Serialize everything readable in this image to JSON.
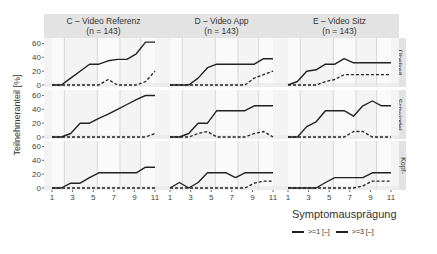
{
  "chart_data": {
    "type": "line",
    "layout": "facet-grid",
    "x": [
      1,
      2,
      3,
      4,
      5,
      6,
      7,
      8,
      9,
      10,
      11
    ],
    "xlabel": "Zeit [min]",
    "ylabel": "Teilnehmeranteil [%]",
    "x_ticks": [
      "1",
      "3",
      "5",
      "7",
      "9",
      "11"
    ],
    "y_ticks": [
      "0",
      "20",
      "40",
      "60"
    ],
    "ylim": [
      0,
      65
    ],
    "xlim": [
      1,
      11
    ],
    "columns": [
      {
        "title": "C – Video Referenz",
        "subtitle": "(n = 143)"
      },
      {
        "title": "D – Video App",
        "subtitle": "(n = 143)"
      },
      {
        "title": "E – Video Sitz",
        "subtitle": "(n = 143)"
      }
    ],
    "rows": [
      "Übelkeit",
      "Schwindel",
      "Kopf-\nschmerzen"
    ],
    "legend": {
      "title": "Symptomausprägung",
      "position": "bottom-right",
      "entries": [
        {
          "label": ">=1 [–]",
          "style": "solid"
        },
        {
          "label": ">=3 [–]",
          "style": "dashed"
        }
      ]
    },
    "shaded_intervals": [
      [
        1,
        2.2
      ],
      [
        5.4,
        7.6
      ],
      [
        9.6,
        11
      ]
    ],
    "panels": [
      {
        "row": 0,
        "col": 0,
        "series": [
          {
            "name": ">=1 [–]",
            "values": [
              0,
              0,
              10,
              20,
              30,
              30,
              35,
              37,
              37,
              45,
              62,
              62
            ]
          },
          {
            "name": ">=3 [–]",
            "values": [
              0,
              0,
              0,
              0,
              0,
              0,
              8,
              0,
              0,
              0,
              5,
              20
            ]
          }
        ]
      },
      {
        "row": 0,
        "col": 1,
        "series": [
          {
            "name": ">=1 [–]",
            "values": [
              0,
              0,
              0,
              10,
              25,
              30,
              30,
              30,
              30,
              30,
              38,
              38
            ]
          },
          {
            "name": ">=3 [–]",
            "values": [
              0,
              0,
              0,
              0,
              0,
              0,
              0,
              0,
              0,
              10,
              15,
              20
            ]
          }
        ]
      },
      {
        "row": 0,
        "col": 2,
        "series": [
          {
            "name": ">=1 [–]",
            "values": [
              0,
              5,
              20,
              22,
              30,
              30,
              38,
              32,
              32,
              32,
              32,
              32
            ]
          },
          {
            "name": ">=3 [–]",
            "values": [
              0,
              0,
              0,
              0,
              5,
              8,
              15,
              15,
              15,
              15,
              15,
              15
            ]
          }
        ]
      },
      {
        "row": 1,
        "col": 0,
        "series": [
          {
            "name": ">=1 [–]",
            "values": [
              0,
              0,
              5,
              20,
              20,
              27,
              33,
              40,
              47,
              54,
              60,
              60
            ]
          },
          {
            "name": ">=3 [–]",
            "values": [
              0,
              0,
              0,
              0,
              0,
              0,
              0,
              0,
              0,
              0,
              0,
              5
            ]
          }
        ]
      },
      {
        "row": 1,
        "col": 1,
        "series": [
          {
            "name": ">=1 [–]",
            "values": [
              0,
              0,
              5,
              20,
              20,
              38,
              38,
              38,
              38,
              45,
              45,
              45
            ]
          },
          {
            "name": ">=3 [–]",
            "values": [
              0,
              0,
              0,
              5,
              8,
              0,
              0,
              0,
              0,
              5,
              8,
              0
            ]
          }
        ]
      },
      {
        "row": 1,
        "col": 2,
        "series": [
          {
            "name": ">=1 [–]",
            "values": [
              0,
              0,
              15,
              22,
              38,
              38,
              38,
              30,
              45,
              52,
              45,
              45
            ]
          },
          {
            "name": ">=3 [–]",
            "values": [
              0,
              0,
              0,
              0,
              0,
              0,
              0,
              8,
              8,
              0,
              0,
              0
            ]
          }
        ]
      },
      {
        "row": 2,
        "col": 0,
        "series": [
          {
            "name": ">=1 [–]",
            "values": [
              0,
              0,
              7,
              7,
              15,
              22,
              22,
              22,
              22,
              22,
              30,
              30
            ]
          },
          {
            "name": ">=3 [–]",
            "values": [
              0,
              0,
              0,
              0,
              0,
              0,
              0,
              0,
              0,
              0,
              0,
              0
            ]
          }
        ]
      },
      {
        "row": 2,
        "col": 1,
        "series": [
          {
            "name": ">=1 [–]",
            "values": [
              0,
              8,
              0,
              8,
              22,
              22,
              22,
              15,
              22,
              22,
              22,
              22
            ]
          },
          {
            "name": ">=3 [–]",
            "values": [
              0,
              0,
              0,
              0,
              0,
              0,
              0,
              0,
              0,
              7,
              10,
              10
            ]
          }
        ]
      },
      {
        "row": 2,
        "col": 2,
        "series": [
          {
            "name": ">=1 [–]",
            "values": [
              0,
              0,
              0,
              0,
              8,
              15,
              15,
              15,
              15,
              22,
              22,
              22
            ]
          },
          {
            "name": ">=3 [–]",
            "values": [
              0,
              0,
              0,
              0,
              0,
              0,
              0,
              0,
              3,
              10,
              10,
              10
            ]
          }
        ]
      }
    ]
  }
}
